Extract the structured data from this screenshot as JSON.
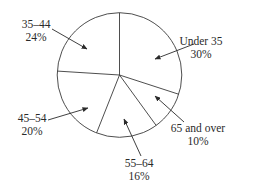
{
  "chart_data": {
    "type": "pie",
    "title": "",
    "start_angle_deg": 0,
    "direction": "clockwise",
    "colors": {
      "fill": "#ffffff",
      "stroke": "#3a3a3a",
      "text": "#2a2a2a"
    },
    "slices": [
      {
        "label": "Under 35",
        "value": 30,
        "pct_label": "30%"
      },
      {
        "label": "65 and over",
        "value": 10,
        "pct_label": "10%"
      },
      {
        "label": "55–64",
        "value": 16,
        "pct_label": "16%"
      },
      {
        "label": "45–54",
        "value": 20,
        "pct_label": "20%"
      },
      {
        "label": "35–44",
        "value": 24,
        "pct_label": "24%"
      }
    ],
    "categories": [
      "Under 35",
      "65 and over",
      "55–64",
      "45–54",
      "35–44"
    ],
    "values": [
      30,
      10,
      16,
      20,
      24
    ],
    "legend": "none (callout labels with arrows)"
  },
  "labels": {
    "under35": {
      "name": "Under 35",
      "pct": "30%"
    },
    "over65": {
      "name": "65 and over",
      "pct": "10%"
    },
    "age55_64": {
      "name": "55–64",
      "pct": "16%"
    },
    "age45_54": {
      "name": "45–54",
      "pct": "20%"
    },
    "age35_44": {
      "name": "35–44",
      "pct": "24%"
    }
  }
}
